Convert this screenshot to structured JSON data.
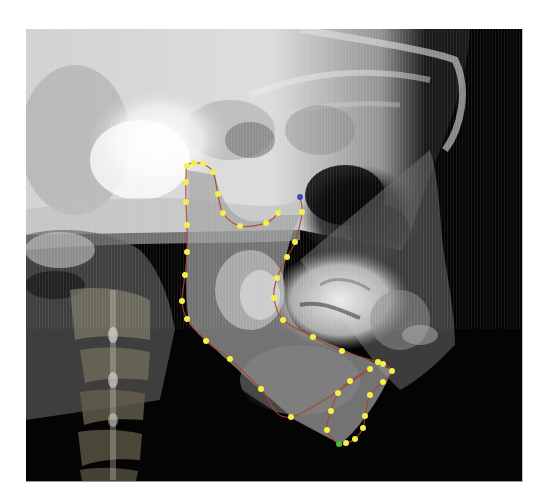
{
  "figure": {
    "type": "lateral cephalometric radiograph",
    "annotation": {
      "structure": "mandible outline",
      "line_color": "#a8452a",
      "point_color": "#f2f04a",
      "start_point_color": "#3a4fb0",
      "end_point_color": "#4bbf3a",
      "points": [
        [
          300,
          197
        ],
        [
          302,
          212
        ],
        [
          295,
          242
        ],
        [
          287,
          257
        ],
        [
          277,
          278
        ],
        [
          274,
          298
        ],
        [
          283,
          320
        ],
        [
          313,
          337
        ],
        [
          342,
          351
        ],
        [
          378,
          362
        ],
        [
          383,
          364
        ],
        [
          392,
          371
        ],
        [
          383,
          382
        ],
        [
          370,
          395
        ],
        [
          365,
          416
        ],
        [
          363,
          428
        ],
        [
          355,
          439
        ],
        [
          346,
          443
        ],
        [
          339,
          444
        ],
        [
          327,
          430
        ],
        [
          331,
          411
        ],
        [
          338,
          393
        ],
        [
          350,
          381
        ],
        [
          370,
          369
        ],
        [
          291,
          417
        ],
        [
          261,
          389
        ],
        [
          230,
          359
        ],
        [
          206,
          341
        ],
        [
          187,
          319
        ],
        [
          182,
          301
        ],
        [
          185,
          275
        ],
        [
          187,
          252
        ],
        [
          187,
          225
        ],
        [
          186,
          202
        ],
        [
          186,
          182
        ],
        [
          187,
          166
        ],
        [
          194,
          163
        ],
        [
          203,
          164
        ],
        [
          213,
          172
        ],
        [
          218,
          194
        ],
        [
          223,
          213
        ],
        [
          240,
          226
        ],
        [
          266,
          223
        ],
        [
          278,
          213
        ]
      ]
    }
  },
  "caption": {
    "text": ""
  }
}
